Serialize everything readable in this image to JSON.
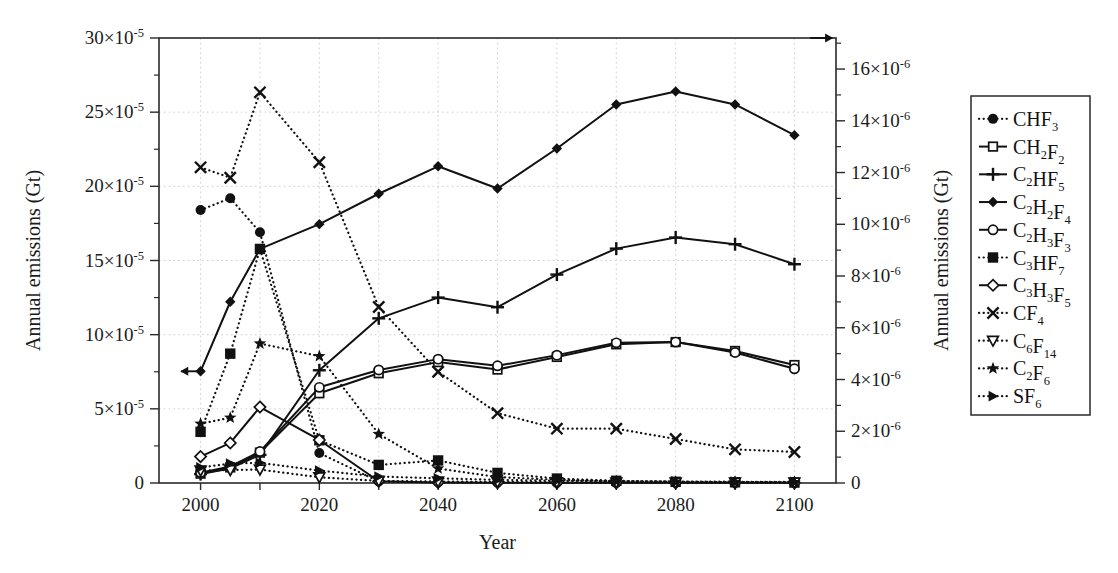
{
  "figure": {
    "left_axis_title": "Annual emissions (Gt)",
    "right_axis_title": "Annual emissions (Gt)",
    "x_axis_title": "Year",
    "left_arrow_glyph": "←",
    "right_arrow_glyph": "→"
  },
  "chart_data": {
    "type": "line",
    "title": "",
    "xlabel": "Year",
    "ylabel": "Annual emissions (Gt)",
    "y2label": "Annual emissions (Gt)",
    "xlim": [
      1993,
      2107
    ],
    "ylim": [
      0,
      0.0003
    ],
    "y2lim": [
      0,
      1.72e-05
    ],
    "grid": true,
    "legend_position": "right-outside",
    "x": [
      2000,
      2005,
      2010,
      2020,
      2030,
      2040,
      2050,
      2060,
      2070,
      2080,
      2090,
      2100
    ],
    "x_tick_values": [
      2000,
      2010,
      2020,
      2030,
      2040,
      2050,
      2060,
      2070,
      2080,
      2090,
      2100
    ],
    "x_tick_labels": [
      "2000",
      "",
      "2020",
      "",
      "2040",
      "",
      "2060",
      "",
      "2080",
      "",
      "2100"
    ],
    "y_tick_values": [
      0,
      5e-05,
      0.0001,
      0.00015,
      0.0002,
      0.00025,
      0.0003
    ],
    "y_tick_labels": [
      "0",
      "5×10⁻⁵",
      "10×10⁻⁵",
      "15×10⁻⁵",
      "20×10⁻⁵",
      "25×10⁻⁵",
      "30×10⁻⁵"
    ],
    "y_tick_mantissas": [
      "0",
      "5",
      "10",
      "15",
      "20",
      "25",
      "30"
    ],
    "y_tick_exponent": "-5",
    "y2_tick_values": [
      0,
      2e-06,
      4e-06,
      6e-06,
      8e-06,
      1e-05,
      1.2e-05,
      1.4e-05,
      1.6e-05
    ],
    "y2_tick_labels": [
      "0",
      "2×10⁻⁶",
      "4×10⁻⁶",
      "6×10⁻⁶",
      "8×10⁻⁶",
      "10×10⁻⁶",
      "12×10⁻⁶",
      "14×10⁻⁶",
      "16×10⁻⁶"
    ],
    "y2_tick_mantissas": [
      "0",
      "2",
      "4",
      "6",
      "8",
      "10",
      "12",
      "14",
      "16"
    ],
    "y2_tick_exponent": "-6",
    "annotations": [
      {
        "name": "left-axis-arrow",
        "glyph": "←",
        "x": 1998.6,
        "y": 7.53e-05,
        "axis": "left"
      },
      {
        "name": "right-axis-arrow",
        "glyph": "→",
        "x": 2104.5,
        "y": 1.72e-05,
        "axis": "right"
      }
    ],
    "series": [
      {
        "name": "CHF3",
        "label_parts": [
          {
            "t": "CHF",
            "k": "n"
          },
          {
            "t": "3",
            "k": "sub"
          }
        ],
        "marker": "filled-circle",
        "linestyle": "dotted",
        "axis": "left",
        "values": [
          0.000184,
          0.000192,
          0.000169,
          2.02e-05,
          1e-06,
          5e-07,
          3e-07,
          2e-07,
          1e-07,
          1e-07,
          1e-07,
          1e-07
        ]
      },
      {
        "name": "CH2F2",
        "label_parts": [
          {
            "t": "CH",
            "k": "n"
          },
          {
            "t": "2",
            "k": "sub"
          },
          {
            "t": "F",
            "k": "n"
          },
          {
            "t": "2",
            "k": "sub"
          }
        ],
        "marker": "open-square",
        "linestyle": "solid",
        "axis": "left",
        "values": [
          6.3e-06,
          1.05e-05,
          2.05e-05,
          6.05e-05,
          7.4e-05,
          8.15e-05,
          7.65e-05,
          8.5e-05,
          9.35e-05,
          9.5e-05,
          8.9e-05,
          7.95e-05
        ]
      },
      {
        "name": "C2HF5",
        "label_parts": [
          {
            "t": "C",
            "k": "n"
          },
          {
            "t": "2",
            "k": "sub"
          },
          {
            "t": "HF",
            "k": "n"
          },
          {
            "t": "5",
            "k": "sub"
          }
        ],
        "marker": "plus",
        "linestyle": "solid",
        "axis": "left",
        "values": [
          6e-06,
          9.8e-06,
          1.9e-05,
          7.6e-05,
          0.000111,
          0.000125,
          0.0001185,
          0.0001405,
          0.000158,
          0.0001655,
          0.000161,
          0.0001475
        ]
      },
      {
        "name": "C2H2F4",
        "label_parts": [
          {
            "t": "C",
            "k": "n"
          },
          {
            "t": "2",
            "k": "sub"
          },
          {
            "t": "H",
            "k": "n"
          },
          {
            "t": "2",
            "k": "sub"
          },
          {
            "t": "F",
            "k": "n"
          },
          {
            "t": "4",
            "k": "sub"
          }
        ],
        "marker": "filled-diamond",
        "linestyle": "solid",
        "axis": "left",
        "values": [
          7.53e-05,
          0.0001222,
          0.0001578,
          0.0001745,
          0.000195,
          0.0002135,
          0.0001985,
          0.0002255,
          0.0002552,
          0.000264,
          0.0002552,
          0.0002345
        ]
      },
      {
        "name": "C2H3F3",
        "label_parts": [
          {
            "t": "C",
            "k": "n"
          },
          {
            "t": "2",
            "k": "sub"
          },
          {
            "t": "H",
            "k": "n"
          },
          {
            "t": "3",
            "k": "sub"
          },
          {
            "t": "F",
            "k": "n"
          },
          {
            "t": "3",
            "k": "sub"
          }
        ],
        "marker": "open-circle",
        "linestyle": "solid",
        "axis": "left",
        "values": [
          7e-06,
          1.12e-05,
          2.12e-05,
          6.45e-05,
          7.62e-05,
          8.35e-05,
          7.9e-05,
          8.62e-05,
          9.45e-05,
          9.5e-05,
          8.8e-05,
          7.7e-05
        ]
      },
      {
        "name": "C3HF7",
        "label_parts": [
          {
            "t": "C",
            "k": "n"
          },
          {
            "t": "3",
            "k": "sub"
          },
          {
            "t": "HF",
            "k": "n"
          },
          {
            "t": "7",
            "k": "sub"
          }
        ],
        "marker": "filled-square",
        "linestyle": "dotted",
        "axis": "left",
        "values": [
          3.45e-05,
          8.72e-05,
          0.0001578,
          2.88e-05,
          1.22e-05,
          1.52e-05,
          6.8e-06,
          3e-06,
          1.5e-06,
          8e-07,
          5e-07,
          3e-07
        ]
      },
      {
        "name": "C3H3F5",
        "label_parts": [
          {
            "t": "C",
            "k": "n"
          },
          {
            "t": "3",
            "k": "sub"
          },
          {
            "t": "H",
            "k": "n"
          },
          {
            "t": "3",
            "k": "sub"
          },
          {
            "t": "F",
            "k": "n"
          },
          {
            "t": "5",
            "k": "sub"
          }
        ],
        "marker": "open-diamond",
        "linestyle": "solid",
        "axis": "left",
        "values": [
          1.78e-05,
          2.7e-05,
          5.12e-05,
          2.9e-05,
          1.2e-06,
          4e-07,
          2e-07,
          1e-07,
          1e-07,
          1e-07,
          1e-07,
          1e-07
        ]
      },
      {
        "name": "CF4",
        "label_parts": [
          {
            "t": "CF",
            "k": "n"
          },
          {
            "t": "4",
            "k": "sub"
          }
        ],
        "marker": "cross",
        "linestyle": "dotted",
        "axis": "right",
        "values": [
          1.22e-05,
          1.18e-05,
          1.51e-05,
          1.24e-05,
          6.8e-06,
          4.3e-06,
          2.7e-06,
          2.1e-06,
          2.1e-06,
          1.7e-06,
          1.3e-06,
          1.2e-06
        ]
      },
      {
        "name": "C6F14",
        "label_parts": [
          {
            "t": "C",
            "k": "n"
          },
          {
            "t": "6",
            "k": "sub"
          },
          {
            "t": "F",
            "k": "n"
          },
          {
            "t": "14",
            "k": "sub"
          }
        ],
        "marker": "open-triangle-down",
        "linestyle": "dotted",
        "axis": "right",
        "values": [
          4.8e-07,
          5e-07,
          5.2e-07,
          2.2e-07,
          8e-08,
          6e-08,
          4e-08,
          3e-08,
          2e-08,
          2e-08,
          2e-08,
          2e-08
        ]
      },
      {
        "name": "C2F6",
        "label_parts": [
          {
            "t": "C",
            "k": "n"
          },
          {
            "t": "2",
            "k": "sub"
          },
          {
            "t": "F",
            "k": "n"
          },
          {
            "t": "6",
            "k": "sub"
          }
        ],
        "marker": "filled-star",
        "linestyle": "dotted",
        "axis": "left",
        "values": [
          4e-05,
          4.4e-05,
          9.4e-05,
          8.55e-05,
          3.3e-05,
          9.8e-06,
          4e-06,
          2.2e-06,
          1.2e-06,
          8e-07,
          6e-07,
          5e-07
        ]
      },
      {
        "name": "SF6",
        "label_parts": [
          {
            "t": "SF",
            "k": "n"
          },
          {
            "t": "6",
            "k": "sub"
          }
        ],
        "marker": "filled-triangle-right",
        "linestyle": "dotted",
        "axis": "right",
        "values": [
          6e-07,
          7.5e-07,
          7.8e-07,
          4.8e-07,
          2.5e-07,
          1.8e-07,
          1.2e-07,
          9e-08,
          7e-08,
          6e-08,
          5e-08,
          4e-08
        ]
      }
    ]
  }
}
